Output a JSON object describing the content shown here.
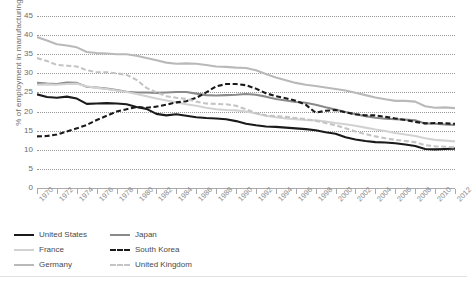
{
  "chart": {
    "ylabel": "% of employment in manufacturing",
    "y_ticks": [
      "0",
      "5",
      "10",
      "15",
      "20",
      "25",
      "30",
      "35",
      "40",
      "45"
    ]
  },
  "legend": {
    "items": [
      {
        "label": "United States",
        "color": "#1a1a1a",
        "dash": "solid",
        "width": 2.2
      },
      {
        "label": "Japan",
        "color": "#8a8a8a",
        "dash": "solid",
        "width": 2.2
      },
      {
        "label": "France",
        "color": "#d2d2d2",
        "dash": "solid",
        "width": 2.2
      },
      {
        "label": "South Korea",
        "color": "#1a1a1a",
        "dash": "dashed",
        "width": 2.2
      },
      {
        "label": "Germany",
        "color": "#b9b9b9",
        "dash": "solid",
        "width": 2.2
      },
      {
        "label": "United Kingdom",
        "color": "#c4c4c4",
        "dash": "dashed",
        "width": 2.2
      }
    ]
  },
  "chart_data": {
    "type": "line",
    "title": "",
    "xlabel": "",
    "ylabel": "% of employment in manufacturing",
    "ylim": [
      0,
      45
    ],
    "xlim": [
      1970,
      2013
    ],
    "grid": true,
    "legend_position": "bottom-left",
    "tick_labels_x": [
      "1970",
      "1972",
      "1974",
      "1976",
      "1978",
      "1980",
      "1982",
      "1984",
      "1986",
      "1988",
      "1990",
      "1992",
      "1994",
      "1996",
      "1998",
      "2000",
      "2002",
      "2004",
      "2006",
      "2008",
      "2010",
      "2012"
    ],
    "tick_labels_y": [
      "0",
      "5",
      "10",
      "15",
      "20",
      "25",
      "30",
      "35",
      "40",
      "45"
    ],
    "x": [
      1970,
      1971,
      1972,
      1973,
      1974,
      1975,
      1976,
      1977,
      1978,
      1979,
      1980,
      1981,
      1982,
      1983,
      1984,
      1985,
      1986,
      1987,
      1988,
      1989,
      1990,
      1991,
      1992,
      1993,
      1994,
      1995,
      1996,
      1997,
      1998,
      1999,
      2000,
      2001,
      2002,
      2003,
      2004,
      2005,
      2006,
      2007,
      2008,
      2009,
      2010,
      2011,
      2012
    ],
    "series": [
      {
        "name": "United States",
        "color": "#1a1a1a",
        "dash": "solid",
        "values": [
          24.5,
          23.8,
          23.6,
          23.9,
          23.4,
          22.0,
          22.1,
          22.2,
          22.1,
          21.9,
          21.2,
          20.7,
          19.4,
          19.0,
          19.3,
          18.9,
          18.5,
          18.3,
          18.2,
          18.0,
          17.5,
          16.8,
          16.4,
          16.1,
          16.0,
          15.8,
          15.6,
          15.4,
          15.1,
          14.6,
          14.2,
          13.3,
          12.7,
          12.3,
          12.0,
          11.9,
          11.7,
          11.4,
          11.0,
          10.2,
          10.1,
          10.2,
          10.3
        ]
      },
      {
        "name": "Japan",
        "color": "#8a8a8a",
        "dash": "solid",
        "values": [
          27.5,
          27.3,
          27.2,
          27.6,
          27.5,
          26.5,
          26.3,
          26.0,
          25.6,
          25.2,
          25.0,
          25.0,
          24.9,
          25.0,
          25.1,
          25.1,
          24.7,
          24.3,
          24.2,
          24.3,
          24.4,
          24.6,
          24.4,
          23.9,
          23.3,
          22.9,
          22.5,
          22.3,
          21.8,
          21.1,
          20.5,
          19.9,
          19.3,
          18.8,
          18.4,
          18.1,
          18.0,
          17.9,
          17.7,
          16.9,
          16.8,
          16.6,
          16.5
        ]
      },
      {
        "name": "France",
        "color": "#d2d2d2",
        "dash": "solid",
        "values": [
          27.0,
          27.1,
          27.0,
          27.2,
          27.3,
          26.6,
          26.2,
          25.9,
          25.5,
          25.1,
          24.6,
          24.0,
          23.4,
          22.9,
          22.4,
          21.9,
          21.5,
          21.0,
          20.6,
          20.4,
          20.3,
          20.0,
          19.5,
          18.9,
          18.5,
          18.2,
          18.0,
          17.8,
          17.7,
          17.4,
          17.0,
          16.7,
          16.3,
          15.8,
          15.3,
          14.9,
          14.4,
          14.0,
          13.6,
          13.0,
          12.6,
          12.4,
          12.2
        ]
      },
      {
        "name": "South Korea",
        "color": "#1a1a1a",
        "dash": "dashed",
        "values": [
          13.5,
          13.6,
          14.0,
          14.8,
          15.6,
          16.5,
          17.8,
          18.9,
          20.0,
          20.6,
          21.2,
          21.0,
          21.3,
          21.8,
          22.4,
          22.7,
          23.6,
          25.0,
          26.6,
          27.2,
          27.2,
          26.9,
          26.0,
          24.8,
          24.0,
          23.5,
          22.8,
          21.8,
          19.7,
          20.2,
          20.4,
          19.8,
          19.3,
          19.0,
          19.0,
          18.6,
          18.2,
          17.8,
          17.3,
          16.9,
          17.0,
          16.9,
          16.8
        ]
      },
      {
        "name": "Germany",
        "color": "#b9b9b9",
        "dash": "solid",
        "values": [
          39.5,
          38.6,
          37.6,
          37.3,
          36.8,
          35.6,
          35.3,
          35.2,
          35.0,
          35.0,
          34.6,
          34.0,
          33.4,
          32.8,
          32.5,
          32.6,
          32.5,
          32.2,
          31.8,
          31.7,
          31.5,
          31.4,
          30.8,
          29.8,
          28.9,
          28.2,
          27.5,
          27.0,
          26.7,
          26.3,
          25.9,
          25.5,
          24.9,
          24.3,
          23.7,
          23.2,
          22.8,
          22.8,
          22.6,
          21.4,
          21.0,
          21.1,
          20.9
        ]
      },
      {
        "name": "United Kingdom",
        "color": "#c4c4c4",
        "dash": "dashed",
        "values": [
          34.0,
          33.2,
          32.2,
          32.0,
          31.8,
          30.8,
          30.3,
          30.3,
          30.0,
          29.6,
          28.3,
          26.2,
          25.0,
          24.0,
          23.6,
          23.3,
          22.6,
          22.1,
          22.0,
          21.9,
          21.5,
          20.6,
          19.6,
          19.0,
          18.8,
          18.6,
          18.3,
          18.0,
          17.6,
          17.0,
          16.4,
          15.6,
          14.8,
          14.1,
          13.5,
          13.0,
          12.6,
          12.3,
          12.0,
          11.2,
          10.9,
          10.8,
          10.6
        ]
      }
    ]
  }
}
